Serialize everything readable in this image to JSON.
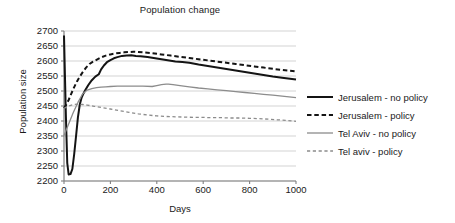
{
  "chart_data": {
    "type": "line",
    "title": "Population change",
    "xlabel": "Days",
    "ylabel": "Population size",
    "xlim": [
      0,
      1000
    ],
    "ylim": [
      2200,
      2700
    ],
    "xticks": [
      0,
      200,
      400,
      600,
      800,
      1000
    ],
    "yticks": [
      2200,
      2250,
      2300,
      2350,
      2400,
      2450,
      2500,
      2550,
      2600,
      2650,
      2700
    ],
    "grid": "horizontal",
    "legend_position": "right",
    "colors": {
      "jerusalem_no_policy": "#141414",
      "jerusalem_policy": "#141414",
      "telaviv_no_policy": "#8c8c8c",
      "telaviv_policy": "#8c8c8c",
      "axis": "#808080",
      "gridline": "#c8c8c8"
    },
    "series": [
      {
        "name": "Jerusalem - no policy",
        "style": "solid",
        "color": "#141414",
        "width": 2.0,
        "x": [
          0,
          8,
          14,
          20,
          28,
          36,
          44,
          52,
          60,
          68,
          76,
          84,
          92,
          105,
          120,
          135,
          150,
          160,
          172,
          185,
          200,
          215,
          230,
          250,
          270,
          290,
          310,
          330,
          360,
          400,
          440,
          480,
          510,
          540,
          580,
          620,
          660,
          700,
          740,
          780,
          820,
          860,
          900,
          940,
          1000
        ],
        "y": [
          2685,
          2420,
          2260,
          2222,
          2223,
          2240,
          2290,
          2350,
          2412,
          2455,
          2478,
          2492,
          2503,
          2520,
          2536,
          2548,
          2556,
          2572,
          2585,
          2596,
          2603,
          2609,
          2613,
          2617,
          2618,
          2619,
          2617,
          2616,
          2613,
          2608,
          2603,
          2598,
          2597,
          2594,
          2588,
          2583,
          2578,
          2573,
          2568,
          2563,
          2558,
          2553,
          2548,
          2544,
          2538
        ]
      },
      {
        "name": "Jerusalem - policy",
        "style": "dashed",
        "color": "#141414",
        "width": 2.0,
        "x": [
          0,
          10,
          20,
          32,
          44,
          56,
          68,
          80,
          95,
          110,
          125,
          140,
          160,
          180,
          200,
          220,
          240,
          260,
          280,
          300,
          320,
          350,
          380,
          420,
          460,
          500,
          540,
          580,
          620,
          660,
          700,
          740,
          780,
          820,
          860,
          900,
          940,
          1000
        ],
        "y": [
          2443,
          2455,
          2470,
          2492,
          2513,
          2532,
          2548,
          2562,
          2578,
          2590,
          2598,
          2604,
          2612,
          2618,
          2622,
          2625,
          2627,
          2629,
          2630,
          2631,
          2630,
          2628,
          2626,
          2622,
          2618,
          2614,
          2610,
          2606,
          2602,
          2598,
          2594,
          2590,
          2586,
          2582,
          2578,
          2574,
          2570,
          2565
        ]
      },
      {
        "name": "Tel Aviv - no policy",
        "style": "solid",
        "color": "#8c8c8c",
        "width": 1.3,
        "x": [
          0,
          20,
          40,
          60,
          80,
          100,
          120,
          140,
          160,
          180,
          200,
          230,
          260,
          300,
          340,
          380,
          400,
          420,
          440,
          450,
          470,
          500,
          540,
          580,
          620,
          660,
          700,
          740,
          780,
          820,
          860,
          900,
          940,
          1000
        ],
        "y": [
          2352,
          2390,
          2428,
          2462,
          2490,
          2503,
          2508,
          2511,
          2513,
          2514,
          2515,
          2516,
          2516,
          2516,
          2516,
          2515,
          2518,
          2521,
          2523,
          2523,
          2521,
          2518,
          2514,
          2510,
          2507,
          2504,
          2501,
          2498,
          2495,
          2492,
          2489,
          2486,
          2483,
          2478
        ]
      },
      {
        "name": "Tel aviv - policy",
        "style": "dashed",
        "color": "#8c8c8c",
        "width": 1.3,
        "x": [
          0,
          20,
          40,
          60,
          80,
          100,
          130,
          160,
          200,
          240,
          280,
          320,
          360,
          400,
          440,
          480,
          520,
          560,
          600,
          640,
          680,
          720,
          760,
          800,
          840,
          880,
          920,
          960,
          1000
        ],
        "y": [
          2442,
          2450,
          2455,
          2456,
          2455,
          2453,
          2449,
          2445,
          2440,
          2434,
          2429,
          2424,
          2420,
          2417,
          2415,
          2414,
          2413,
          2412,
          2412,
          2411,
          2411,
          2410,
          2410,
          2409,
          2408,
          2406,
          2404,
          2402,
          2399
        ]
      }
    ]
  },
  "legend": {
    "items": [
      {
        "label": "Jerusalem - no policy"
      },
      {
        "label": "Jerusalem - policy"
      },
      {
        "label": "Tel Aviv - no policy"
      },
      {
        "label": "Tel aviv - policy"
      }
    ]
  }
}
